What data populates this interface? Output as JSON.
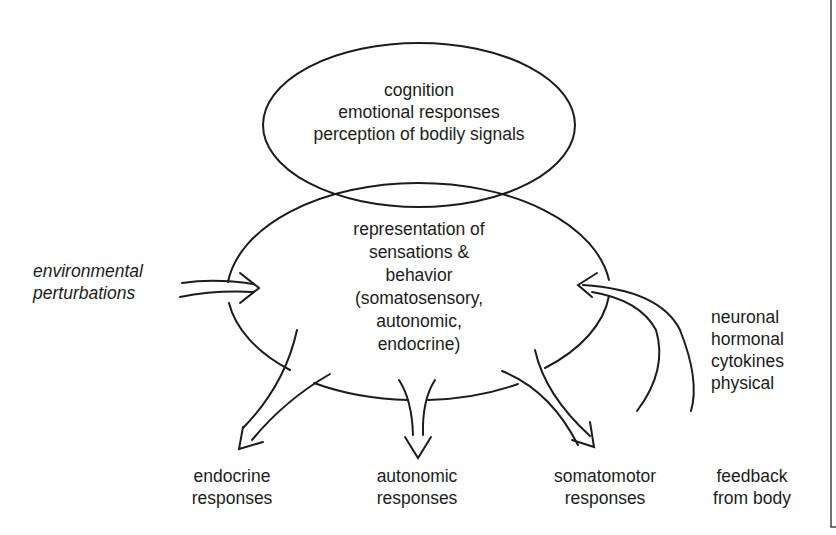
{
  "diagram": {
    "top_ellipse": {
      "lines": [
        "cognition",
        "emotional responses",
        "perception of bodily signals"
      ]
    },
    "center_ellipse": {
      "lines": [
        "representation of",
        "sensations &",
        "behavior",
        "(somatosensory,",
        "autonomic,",
        "endocrine)"
      ]
    },
    "inputs": {
      "environmental": {
        "lines": [
          "environmental",
          "perturbations"
        ]
      },
      "body_signals": {
        "lines": [
          "neuronal",
          "hormonal",
          "cytokines",
          "physical"
        ]
      }
    },
    "outputs": [
      {
        "lines": [
          "endocrine",
          "responses"
        ]
      },
      {
        "lines": [
          "autonomic",
          "responses"
        ]
      },
      {
        "lines": [
          "somatomotor",
          "responses"
        ]
      },
      {
        "lines": [
          "feedback",
          "from body"
        ]
      }
    ],
    "colors": {
      "stroke": "#1c1c1c",
      "background": "#ffffff"
    }
  }
}
